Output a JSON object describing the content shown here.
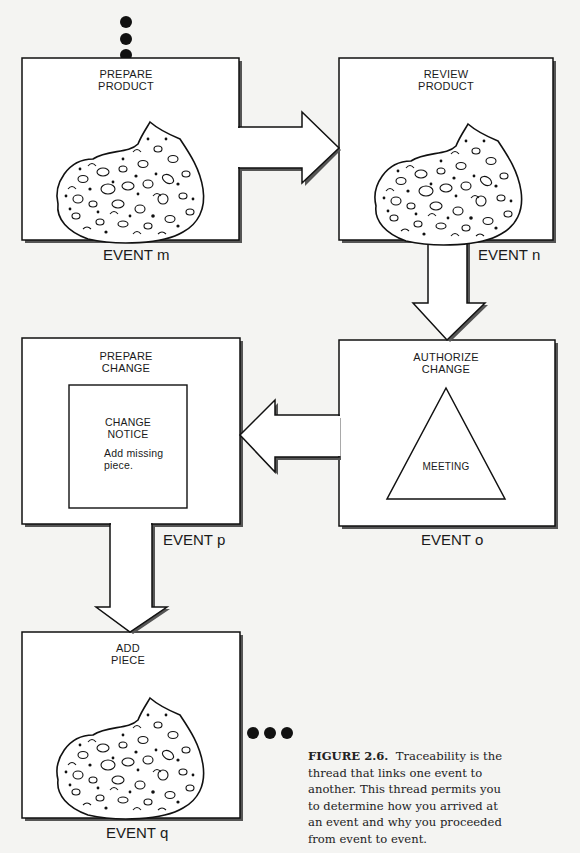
{
  "figure": {
    "number": "FIGURE 2.6.",
    "caption": "Traceability is the thread that links one event to another. This thread permits you to determine how you arrived at an event and why you proceeded from event to event."
  },
  "events": [
    {
      "id": "m",
      "title_line1": "PREPARE",
      "title_line2": "PRODUCT",
      "label": "EVENT m",
      "content": "product-blob"
    },
    {
      "id": "n",
      "title_line1": "REVIEW",
      "title_line2": "PRODUCT",
      "label": "EVENT n",
      "content": "product-blob"
    },
    {
      "id": "o",
      "title_line1": "AUTHORIZE",
      "title_line2": "CHANGE",
      "label": "EVENT o",
      "content": "meeting-triangle",
      "inner_label": "MEETING"
    },
    {
      "id": "p",
      "title_line1": "PREPARE",
      "title_line2": "CHANGE",
      "label": "EVENT p",
      "content": "change-notice",
      "notice": {
        "title_line1": "CHANGE",
        "title_line2": "NOTICE",
        "body_line1": "Add missing",
        "body_line2": "piece."
      }
    },
    {
      "id": "q",
      "title_line1": "ADD",
      "title_line2": "PIECE",
      "label": "EVENT q",
      "content": "product-blob"
    }
  ],
  "flow": [
    "m → n",
    "n → o",
    "o → p",
    "p → q"
  ],
  "colors": {
    "ink": "#1a1a1a",
    "paper": "#f4f4f2",
    "shadow": "#555555"
  }
}
